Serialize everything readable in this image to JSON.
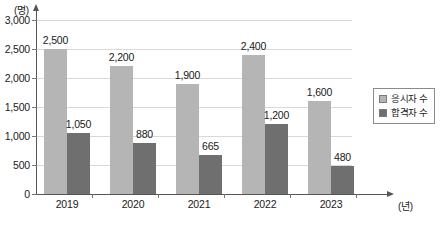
{
  "chart_data": {
    "type": "bar",
    "title": "",
    "subtitle": "",
    "xlabel": "(년)",
    "ylabel": "(명)",
    "categories": [
      "2019",
      "2020",
      "2021",
      "2022",
      "2023"
    ],
    "series": [
      {
        "name": "응시자 수",
        "color": "#b5b5b5",
        "values": [
          2500,
          2200,
          1900,
          2400,
          1600
        ],
        "value_labels": [
          "2,500",
          "2,200",
          "1,900",
          "2,400",
          "1,600"
        ]
      },
      {
        "name": "합격자 수",
        "color": "#6f6f6f",
        "values": [
          1050,
          880,
          665,
          1200,
          480
        ],
        "value_labels": [
          "1,050",
          "880",
          "665",
          "1,200",
          "480"
        ]
      }
    ],
    "ylim": [
      0,
      3000
    ],
    "yticks": [
      0,
      500,
      1000,
      1500,
      2000,
      2500,
      3000
    ],
    "ytick_labels": [
      "0",
      "500",
      "1,000",
      "1,500",
      "2,000",
      "2,500",
      "3,000"
    ],
    "grid": true,
    "legend_position": "right"
  },
  "axes": {
    "y_unit": "(명)",
    "x_unit": "(년)"
  },
  "colors": {
    "series_applicants": "#b5b5b5",
    "series_passers": "#6f6f6f",
    "gridline": "#d9d9d9",
    "axis": "#555555",
    "background": "#ffffff"
  }
}
